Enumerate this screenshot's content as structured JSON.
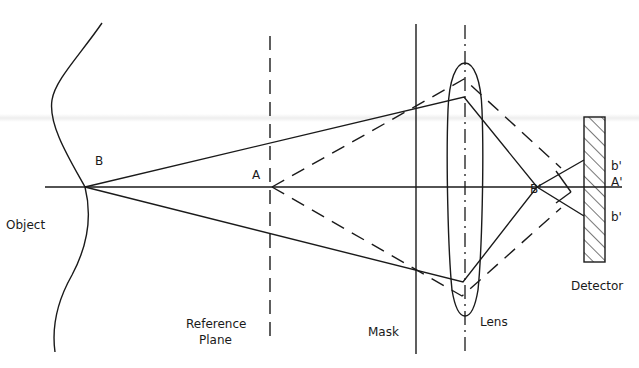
{
  "diagram": {
    "type": "optical-ray-diagram",
    "labels": {
      "object": "Object",
      "point_b": "B",
      "point_a": "A",
      "reference_plane_line1": "Reference",
      "reference_plane_line2": "Plane",
      "mask": "Mask",
      "lens": "Lens",
      "detector": "Detector",
      "image_b_prime": "B'",
      "image_a_prime": "A'",
      "image_b_prime_upper": "b'",
      "image_b_prime_lower": "b'"
    },
    "colors": {
      "ink": "#1a1a1a",
      "background": "#ffffff"
    },
    "elements": [
      "object-surface",
      "optical-axis",
      "reference-plane",
      "mask",
      "lens",
      "detector"
    ],
    "rays": {
      "solid": "rays from point B through lens converging at B' then diverging to detector",
      "dashed": "rays from point A through lens converging toward A' on detector"
    }
  }
}
